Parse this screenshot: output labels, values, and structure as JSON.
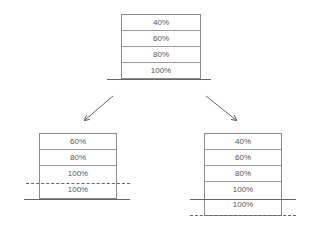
{
  "top_stack": {
    "cells": [
      "40%",
      "60%",
      "80%",
      "100%"
    ]
  },
  "left_stack": {
    "cells": [
      "60%",
      "80%",
      "100%",
      "100%"
    ],
    "dashed_line_between": [
      2,
      3
    ]
  },
  "right_stack": {
    "cells": [
      "40%",
      "60%",
      "80%",
      "100%",
      "100%"
    ],
    "solid_line_between": [
      3,
      4
    ],
    "dashed_line_below": true
  },
  "arrows": [
    {
      "name": "arrow-left",
      "direction": "down-left"
    },
    {
      "name": "arrow-right",
      "direction": "down-right"
    }
  ],
  "colors": {
    "line": "#666666",
    "border": "#8a8a8a",
    "text": "#555555"
  }
}
